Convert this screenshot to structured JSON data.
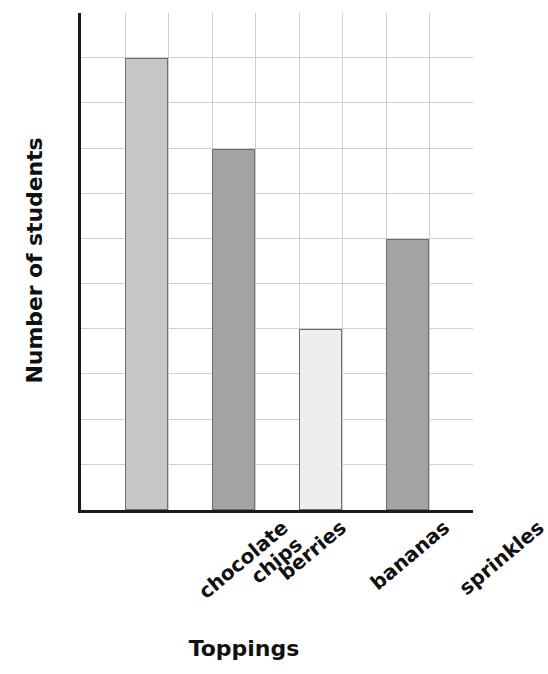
{
  "chart_data": {
    "type": "bar",
    "title": "",
    "xlabel": "Toppings",
    "ylabel": "Number of students",
    "categories": [
      "chocolate chips",
      "berries",
      "bananas",
      "sprinkles"
    ],
    "category_lines": [
      [
        "chocolate",
        "chips"
      ],
      [
        "berries"
      ],
      [
        "bananas"
      ],
      [
        "sprinkles"
      ]
    ],
    "values": [
      10,
      8,
      4,
      6
    ],
    "ylim": [
      0,
      11
    ],
    "y_tick_values": [
      0,
      1,
      2,
      3,
      4,
      5,
      6,
      7,
      8,
      9,
      10,
      11
    ],
    "y_tick_labels_shown": false,
    "grid": true,
    "grid_color": "#cfcfcf",
    "axis_color": "#1a1a1a",
    "bar_edge_color": "#6e6e6e",
    "bar_colors": [
      "#c6c6c6",
      "#a3a3a3",
      "#eeeeee",
      "#a3a3a3"
    ],
    "legend": null,
    "x_tick_rotation": -40
  },
  "axes": {
    "y_title": "Number of students",
    "x_title": "Toppings"
  }
}
